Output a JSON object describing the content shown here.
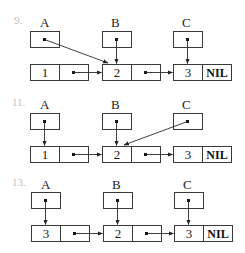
{
  "diagrams": [
    {
      "number": "9.",
      "pointers": [
        "A",
        "B",
        "C"
      ],
      "nodes": [
        {
          "value": "1"
        },
        {
          "value": "2"
        },
        {
          "value": "3",
          "next": "NIL"
        }
      ],
      "description": "A points to node 2, B points to node 2, C points to node 3; node 1 -> node 2 -> node 3 -> NIL"
    },
    {
      "number": "11.",
      "pointers": [
        "A",
        "B",
        "C"
      ],
      "nodes": [
        {
          "value": "1"
        },
        {
          "value": "2"
        },
        {
          "value": "3",
          "next": "NIL"
        }
      ],
      "description": "A points to node 1, B points to node 2, C points to node 2; node 1 -> node 2 -> node 3 -> NIL"
    },
    {
      "number": "13.",
      "pointers": [
        "A",
        "B",
        "C"
      ],
      "nodes": [
        {
          "value": "3"
        },
        {
          "value": "2"
        },
        {
          "value": "3",
          "next": "NIL"
        }
      ],
      "description": "A points to node 1, B points to node 2, C points to node 3; node 1 -> node 2 -> node 3 -> NIL"
    }
  ]
}
